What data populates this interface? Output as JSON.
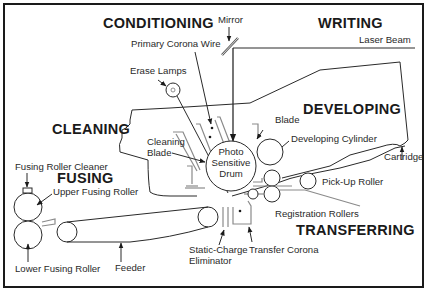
{
  "diagram": {
    "type": "laser-printer-process",
    "stages": {
      "conditioning": "CONDITIONING",
      "writing": "WRITING",
      "cleaning": "CLEANING",
      "developing": "DEVELOPING",
      "fusing": "FUSING",
      "transferring": "TRANSFERRING"
    },
    "labels": {
      "mirror": "Mirror",
      "laser_beam": "Laser Beam",
      "primary_corona_wire": "Primary Corona Wire",
      "erase_lamps": "Erase Lamps",
      "cleaning_blade_1": "Cleaning",
      "cleaning_blade_2": "Blade",
      "drum_1": "Photo",
      "drum_2": "Sensitive",
      "drum_3": "Drum",
      "blade": "Blade",
      "developing_cylinder": "Developing Cylinder",
      "cartridge": "Cartridge",
      "fusing_roller_cleaner": "Fusing Roller Cleaner",
      "upper_fusing_roller": "Upper Fusing Roller",
      "lower_fusing_roller": "Lower Fusing Roller",
      "pick_up_roller": "Pick-Up Roller",
      "registration_rollers": "Registration Rollers",
      "feeder": "Feeder",
      "static_charge_1": "Static-Charge",
      "static_charge_2": "Eliminator",
      "transfer_corona": "Transfer Corona"
    }
  }
}
